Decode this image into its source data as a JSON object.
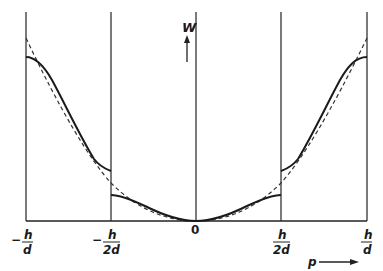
{
  "diagram": {
    "type": "energy band diagram",
    "vertical_axis": {
      "label": "W",
      "arrow": "up"
    },
    "horizontal_axis": {
      "label": "p",
      "arrow": "right"
    },
    "tick_labels": [
      {
        "sign": "−",
        "num": "h",
        "den": "d"
      },
      {
        "sign": "−",
        "num": "h",
        "den": "2d"
      },
      {
        "sign": "",
        "num": "0",
        "den": ""
      },
      {
        "sign": "",
        "num": "h",
        "den": "2d"
      },
      {
        "sign": "",
        "num": "h",
        "den": "d"
      }
    ],
    "curves": {
      "solid": "energy W(p) with band gaps at zone boundaries",
      "dashed": "free-particle parabola"
    },
    "colors": {
      "line": "#1a1a1a",
      "grid": "#333333",
      "background": "#ffffff"
    }
  }
}
